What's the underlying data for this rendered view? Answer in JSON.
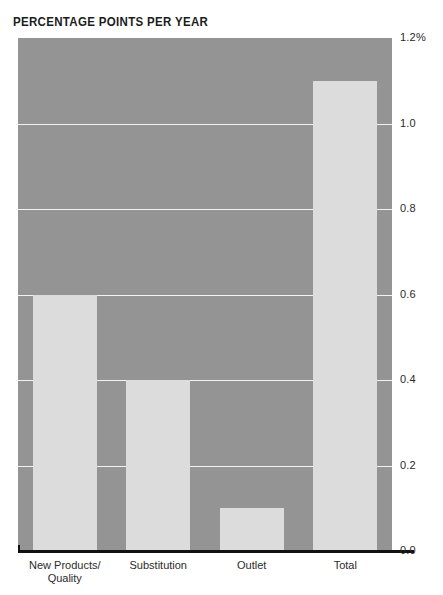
{
  "chart_data": {
    "type": "bar",
    "title": "PERCENTAGE POINTS PER YEAR",
    "xlabel": "",
    "ylabel": "",
    "categories": [
      "New Products/\nQuality",
      "Substitution",
      "Outlet",
      "Total"
    ],
    "values": [
      0.6,
      0.4,
      0.1,
      1.1
    ],
    "ylim": [
      0.0,
      1.2
    ],
    "ytick_values": [
      1.2,
      1.0,
      0.8,
      0.6,
      0.4,
      0.2,
      0.0
    ],
    "ytick_labels": [
      "1.2%",
      "1.0",
      "0.8",
      "0.6",
      "0.4",
      "0.2",
      "0.0"
    ],
    "grid": true,
    "gridlines_at": [
      1.0,
      0.8,
      0.6,
      0.4,
      0.2
    ],
    "legend": null,
    "colors": {
      "plot_background": "#949494",
      "bar_fill": "#dcdcdc",
      "gridline": "#f2f2f2",
      "axis": "#111111",
      "text": "#2b2b2b",
      "title_text": "#1c1c1c",
      "page_background": "#ffffff"
    }
  },
  "top_clipped_text": "",
  "axis": {
    "baseline_label": "0.0"
  }
}
